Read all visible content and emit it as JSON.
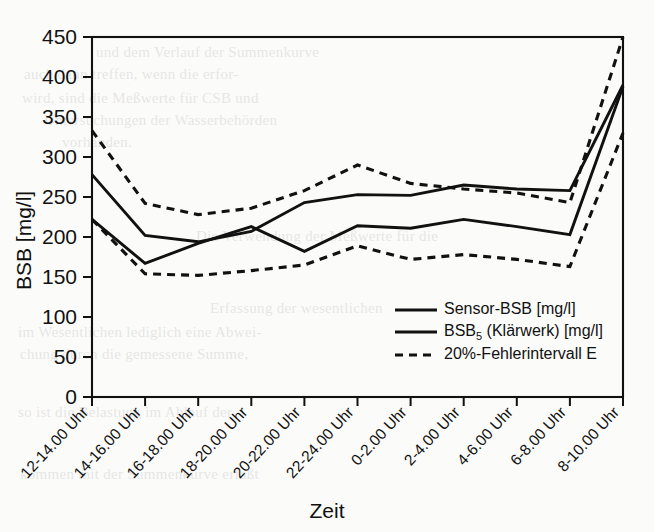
{
  "figure": {
    "background_color": "#fbfbfa",
    "ink_color": "#111111"
  },
  "axes": {
    "y_title": "BSB [mg/l]",
    "x_title": "Zeit",
    "y_ticks": [
      "0",
      "50",
      "100",
      "150",
      "200",
      "250",
      "300",
      "350",
      "400",
      "450"
    ],
    "x_ticks": [
      "12-14.00 Uhr",
      "14-16.00 Uhr",
      "16-18.00 Uhr",
      "18-20.00 Uhr",
      "20-22.00 Uhr",
      "22-24.00 Uhr",
      "0-2.00 Uhr",
      "2-4.00 Uhr",
      "4-6.00 Uhr",
      "6-8.00 Uhr",
      "8-10.00 Uhr"
    ]
  },
  "legend": {
    "position": "inside-bottom-right",
    "entries": [
      {
        "label": "Sensor-BSB [mg/l]",
        "style": "solid"
      },
      {
        "label_main": "BSB",
        "label_sub": "5",
        "label_tail": " (Klärwerk) [mg/l]",
        "style": "solid"
      },
      {
        "label": "20%-Fehlerintervall E",
        "style": "dashed"
      }
    ]
  },
  "chart_data": {
    "type": "line",
    "title": "",
    "xlabel": "Zeit",
    "ylabel": "BSB [mg/l]",
    "ylim": [
      0,
      450
    ],
    "ytick_step": 50,
    "grid": false,
    "legend_position": "inside-bottom-right",
    "categories": [
      "12-14.00 Uhr",
      "14-16.00 Uhr",
      "16-18.00 Uhr",
      "18-20.00 Uhr",
      "20-22.00 Uhr",
      "22-24.00 Uhr",
      "0-2.00 Uhr",
      "2-4.00 Uhr",
      "4-6.00 Uhr",
      "6-8.00 Uhr",
      "8-10.00 Uhr"
    ],
    "series": [
      {
        "name": "Sensor-BSB [mg/l]",
        "style": "solid",
        "values": [
          278,
          202,
          194,
          207,
          243,
          253,
          252,
          265,
          260,
          258,
          390
        ]
      },
      {
        "name": "BSB5 (Klärwerk) [mg/l]",
        "style": "solid",
        "values": [
          222,
          167,
          192,
          213,
          182,
          214,
          211,
          222,
          213,
          203,
          388
        ]
      },
      {
        "name": "20%-Fehlerintervall E (oben)",
        "style": "dashed",
        "values": [
          333,
          242,
          228,
          236,
          258,
          290,
          267,
          260,
          255,
          243,
          450
        ]
      },
      {
        "name": "20%-Fehlerintervall E (unten)",
        "style": "dashed",
        "values": [
          222,
          154,
          152,
          158,
          165,
          189,
          172,
          178,
          172,
          163,
          330
        ]
      }
    ]
  },
  "scan_bleed": {
    "lines": [
      {
        "text": "und dem Verlauf der Summenkurve",
        "x": 96,
        "y": 44
      },
      {
        "text": "auch dann treffen, wenn die erfor-",
        "x": 24,
        "y": 66
      },
      {
        "text": "wird, sind die Meßwerte für CSB und",
        "x": 22,
        "y": 90
      },
      {
        "text": "Untersuchungen der Wasserbehörden",
        "x": 44,
        "y": 112
      },
      {
        "text": "vorhanden.",
        "x": 62,
        "y": 134
      },
      {
        "text": "Die Verwendung der Meßwerte für die",
        "x": 196,
        "y": 228
      },
      {
        "text": "Erfassung der wesentlichen",
        "x": 210,
        "y": 300
      },
      {
        "text": "im Wesentlichen lediglich eine Abwei-",
        "x": 18,
        "y": 324
      },
      {
        "text": "chung durch die gemessene Summe,",
        "x": 20,
        "y": 346
      },
      {
        "text": "so ist die Belastung im Ablauf der",
        "x": 18,
        "y": 404
      },
      {
        "text": "kommen mit der Summenkurve erfaßt",
        "x": 20,
        "y": 466
      }
    ]
  }
}
